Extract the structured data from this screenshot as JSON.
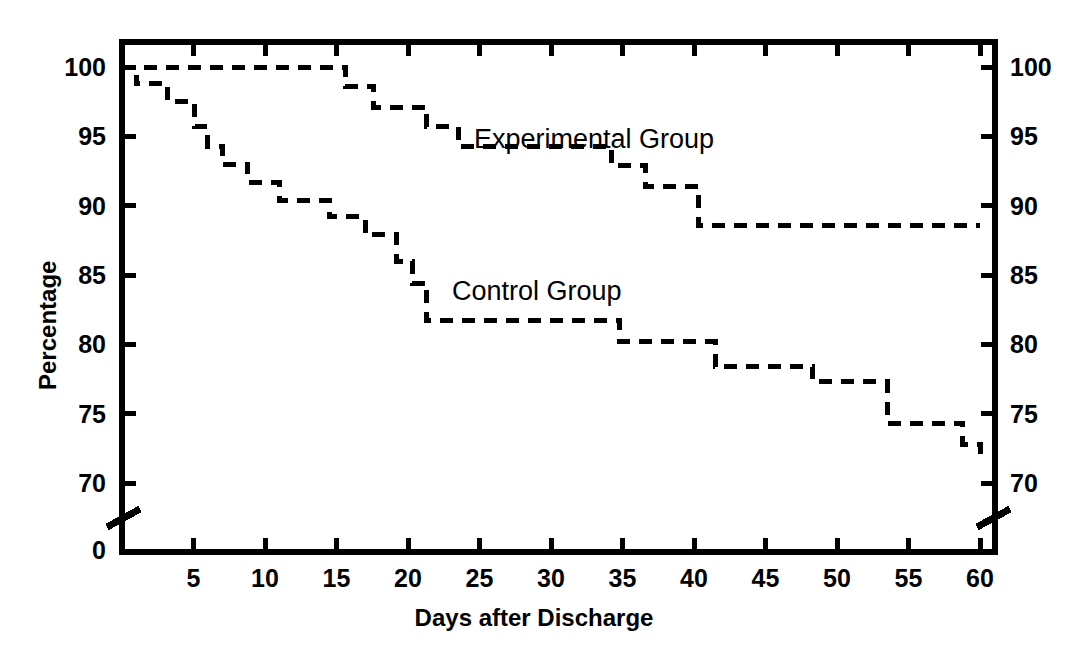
{
  "chart": {
    "type": "line",
    "title": "",
    "xlabel": "Days after Discharge",
    "ylabel": "Percentage",
    "xlim": [
      0,
      60
    ],
    "ylim": [
      68,
      101
    ],
    "grid": false,
    "legend_position": "inline-annotations",
    "axis_break_y": true,
    "y_break_label": "0",
    "line_style": "dashed",
    "line_color": "#000000",
    "xticks": [
      5,
      10,
      15,
      20,
      25,
      30,
      35,
      40,
      45,
      50,
      55,
      60
    ],
    "yticks": [
      70,
      75,
      80,
      85,
      90,
      95,
      100
    ],
    "yticks_right": [
      70,
      75,
      80,
      85,
      90,
      95,
      100
    ]
  },
  "chart_data": {
    "type": "line",
    "title": "",
    "xlabel": "Days after Discharge",
    "ylabel": "Percentage",
    "xlim": [
      0,
      60
    ],
    "ylim": [
      68,
      101
    ],
    "grid": false,
    "legend_position": "inline-annotations",
    "series": [
      {
        "name": "Experimental Group",
        "style": "dashed-step",
        "x": [
          0,
          14.6,
          15.6,
          16.6,
          17.6,
          20.3,
          21.3,
          22.5,
          23.5,
          33.0,
          34.2,
          35.6,
          36.6,
          39.3,
          40.3,
          60.0
        ],
        "values": [
          100.0,
          100.0,
          98.6,
          98.6,
          97.1,
          97.1,
          95.7,
          95.7,
          94.3,
          94.3,
          92.9,
          92.9,
          91.4,
          91.4,
          88.6,
          88.6
        ]
      },
      {
        "name": "Control Group",
        "style": "dashed-step",
        "x": [
          0,
          1.0,
          2.2,
          3.2,
          4.3,
          5.1,
          6.0,
          7.0,
          8.0,
          8.8,
          10.0,
          11.0,
          13.5,
          14.5,
          16.0,
          17.0,
          18.2,
          19.2,
          20.3,
          21.3,
          33.8,
          34.8,
          40.5,
          41.5,
          47.3,
          48.3,
          52.5,
          53.5,
          58.8,
          60.0
        ],
        "values": [
          100.0,
          98.8,
          98.8,
          97.5,
          97.5,
          95.7,
          94.3,
          93.0,
          93.0,
          91.7,
          91.7,
          90.4,
          90.4,
          89.2,
          89.2,
          87.9,
          87.9,
          86.0,
          84.4,
          81.7,
          81.7,
          80.2,
          80.2,
          78.4,
          78.4,
          77.3,
          77.3,
          74.3,
          72.8,
          71.8
        ]
      }
    ],
    "annotations": [
      {
        "text": "Experimental Group",
        "x": 25.0,
        "y": 95.5
      },
      {
        "text": "Control Group",
        "x": 23.5,
        "y": 84.5
      }
    ]
  },
  "labels": {
    "experimental": "Experimental Group",
    "control": "Control Group"
  }
}
